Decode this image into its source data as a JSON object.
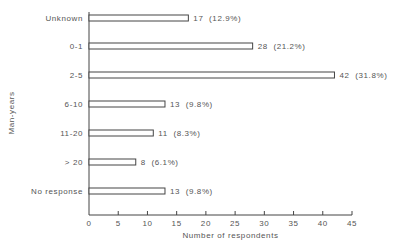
{
  "chart_data": {
    "type": "bar",
    "orientation": "horizontal",
    "title": "",
    "xlabel": "Number of respondents",
    "ylabel": "Man-years",
    "categories": [
      "Unknown",
      "0-1",
      "2-5",
      "6-10",
      "11-20",
      "> 20",
      "No response"
    ],
    "values": [
      17,
      28,
      42,
      13,
      11,
      8,
      13
    ],
    "value_labels": [
      "17  (12.9%)",
      "28  (21.2%)",
      "42  (31.8%)",
      "13  (9.8%)",
      "11  (8.3%)",
      "8  (6.1%)",
      "13  (9.8%)"
    ],
    "percentages": [
      12.9,
      21.2,
      31.8,
      9.8,
      8.3,
      6.1,
      9.8
    ],
    "xlim": [
      0,
      45
    ],
    "xticks": [
      0,
      5,
      10,
      15,
      20,
      25,
      30,
      35,
      40,
      45
    ],
    "grid": false,
    "legend": null,
    "bar_fill": "#ffffff",
    "bar_stroke": "#444444"
  }
}
